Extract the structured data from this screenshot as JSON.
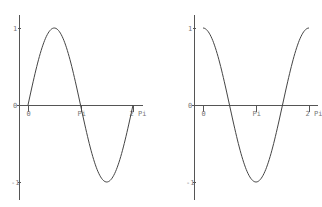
{
  "chart_data": [
    {
      "type": "line",
      "title": "",
      "function": "sin(x)",
      "xlabel": "",
      "ylabel": "",
      "xlim": [
        0,
        6.2832
      ],
      "ylim": [
        -1,
        1
      ],
      "grid": false,
      "legend": null,
      "x_ticks": [
        {
          "value": 0,
          "label": "0"
        },
        {
          "value": 3.1416,
          "label": "Pi"
        },
        {
          "value": 6.2832,
          "label": "2 Pi"
        }
      ],
      "y_ticks": [
        {
          "value": 1,
          "label": "1"
        },
        {
          "value": 0,
          "label": "0"
        },
        {
          "value": -1,
          "label": "-1"
        }
      ],
      "x": [
        0,
        0.7854,
        1.5708,
        2.3562,
        3.1416,
        3.927,
        4.7124,
        5.4978,
        6.2832
      ],
      "series": [
        {
          "name": "sin",
          "values": [
            0,
            0.707,
            1,
            0.707,
            0,
            -0.707,
            -1,
            -0.707,
            0
          ]
        }
      ]
    },
    {
      "type": "line",
      "title": "",
      "function": "cos(x)",
      "xlabel": "",
      "ylabel": "",
      "xlim": [
        0,
        6.2832
      ],
      "ylim": [
        -1,
        1
      ],
      "grid": false,
      "legend": null,
      "x_ticks": [
        {
          "value": 0,
          "label": "0"
        },
        {
          "value": 3.1416,
          "label": "Pi"
        },
        {
          "value": 6.2832,
          "label": "2 Pi"
        }
      ],
      "y_ticks": [
        {
          "value": 1,
          "label": "1"
        },
        {
          "value": 0,
          "label": "0"
        },
        {
          "value": -1,
          "label": "-1"
        }
      ],
      "x": [
        0,
        0.7854,
        1.5708,
        2.3562,
        3.1416,
        3.927,
        4.7124,
        5.4978,
        6.2832
      ],
      "series": [
        {
          "name": "cos",
          "values": [
            1,
            0.707,
            0,
            -0.707,
            -1,
            -0.707,
            0,
            0.707,
            1
          ]
        }
      ]
    }
  ],
  "layout": {
    "panels": [
      {
        "yaxis_x": 19,
        "yaxis_top": 15,
        "yaxis_bottom": 200,
        "xaxis_y": 105,
        "xaxis_left": 17,
        "xaxis_right": 143,
        "x0_px": 28,
        "x2pi_px": 133,
        "y1_px": 28,
        "ym1_px": 182
      },
      {
        "yaxis_x": 194,
        "yaxis_top": 15,
        "yaxis_bottom": 200,
        "xaxis_y": 105,
        "xaxis_left": 192,
        "xaxis_right": 318,
        "x0_px": 203,
        "x2pi_px": 309,
        "y1_px": 28,
        "ym1_px": 182
      }
    ]
  }
}
